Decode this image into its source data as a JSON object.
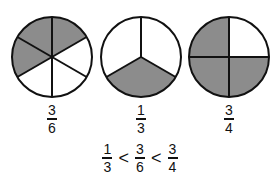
{
  "colors": {
    "shaded": "#8c8c8c",
    "unshaded": "#ffffff",
    "stroke": "#111111"
  },
  "circles": [
    {
      "parts": 6,
      "shaded": 3,
      "label": {
        "num": "3",
        "den": "6"
      }
    },
    {
      "parts": 3,
      "shaded": 1,
      "label": {
        "num": "1",
        "den": "3"
      }
    },
    {
      "parts": 4,
      "shaded": 3,
      "label": {
        "num": "3",
        "den": "4"
      }
    }
  ],
  "inequality": {
    "terms": [
      {
        "num": "1",
        "den": "3"
      },
      {
        "num": "3",
        "den": "6"
      },
      {
        "num": "3",
        "den": "4"
      }
    ],
    "operators": [
      "<",
      "<"
    ]
  }
}
